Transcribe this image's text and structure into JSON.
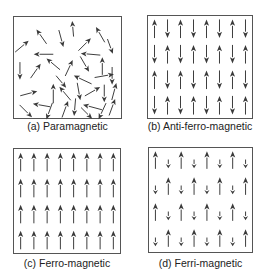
{
  "colors": {
    "arrow": "#3a3a3a",
    "border": "#555555",
    "caption": "#222222"
  },
  "panels": [
    {
      "id": "a",
      "caption": "(a) Paramagnetic",
      "type": "paramagnetic",
      "box": {
        "x": 13,
        "y": 16,
        "w": 109,
        "h": 103
      },
      "caption_pos": {
        "x": 13,
        "y": 120,
        "w": 109
      }
    },
    {
      "id": "b",
      "caption": "(b) Anti-ferro-magnetic",
      "type": "anti-ferromagnetic",
      "box": {
        "x": 147,
        "y": 15,
        "w": 106,
        "h": 104
      },
      "caption_pos": {
        "x": 135,
        "y": 120,
        "w": 130
      }
    },
    {
      "id": "c",
      "caption": "(c) Ferro-magnetic",
      "type": "ferromagnetic",
      "box": {
        "x": 13,
        "y": 148,
        "w": 108,
        "h": 106
      },
      "caption_pos": {
        "x": 13,
        "y": 257,
        "w": 108
      }
    },
    {
      "id": "d",
      "caption": "(d) Ferri-magnetic",
      "type": "ferrimagnetic",
      "box": {
        "x": 148,
        "y": 147,
        "w": 105,
        "h": 106
      },
      "caption_pos": {
        "x": 143,
        "y": 257,
        "w": 115
      }
    }
  ],
  "grid": {
    "rows": 4,
    "cols": 8
  },
  "paramagnetic_arrows": [
    {
      "x": 8,
      "y": 30,
      "angle": -40,
      "len": 18
    },
    {
      "x": 28,
      "y": 20,
      "angle": -125,
      "len": 18
    },
    {
      "x": 48,
      "y": 22,
      "angle": 75,
      "len": 18
    },
    {
      "x": 60,
      "y": 12,
      "angle": -95,
      "len": 16
    },
    {
      "x": 72,
      "y": 28,
      "angle": -45,
      "len": 18
    },
    {
      "x": 88,
      "y": 18,
      "angle": -120,
      "len": 18
    },
    {
      "x": 98,
      "y": 30,
      "angle": 70,
      "len": 16
    },
    {
      "x": 30,
      "y": 38,
      "angle": 180,
      "len": 20
    },
    {
      "x": 78,
      "y": 38,
      "angle": 185,
      "len": 20
    },
    {
      "x": 6,
      "y": 55,
      "angle": 90,
      "len": 18
    },
    {
      "x": 22,
      "y": 55,
      "angle": -55,
      "len": 18
    },
    {
      "x": 40,
      "y": 48,
      "angle": -140,
      "len": 18
    },
    {
      "x": 56,
      "y": 52,
      "angle": -65,
      "len": 18
    },
    {
      "x": 72,
      "y": 48,
      "angle": 60,
      "len": 18
    },
    {
      "x": 90,
      "y": 50,
      "angle": -90,
      "len": 18
    },
    {
      "x": 100,
      "y": 60,
      "angle": 90,
      "len": 18
    },
    {
      "x": 48,
      "y": 66,
      "angle": 50,
      "len": 16
    },
    {
      "x": 70,
      "y": 64,
      "angle": -155,
      "len": 20
    },
    {
      "x": 92,
      "y": 60,
      "angle": -10,
      "len": 20
    },
    {
      "x": 15,
      "y": 78,
      "angle": -15,
      "len": 18
    },
    {
      "x": 40,
      "y": 78,
      "angle": -90,
      "len": 20
    },
    {
      "x": 52,
      "y": 78,
      "angle": -130,
      "len": 18
    },
    {
      "x": 66,
      "y": 76,
      "angle": 80,
      "len": 18
    },
    {
      "x": 80,
      "y": 76,
      "angle": -30,
      "len": 18
    },
    {
      "x": 92,
      "y": 78,
      "angle": 90,
      "len": 18
    },
    {
      "x": 102,
      "y": 76,
      "angle": -75,
      "len": 18
    },
    {
      "x": 28,
      "y": 90,
      "angle": 190,
      "len": 18
    },
    {
      "x": 12,
      "y": 96,
      "angle": 45,
      "len": 18
    },
    {
      "x": 36,
      "y": 96,
      "angle": 110,
      "len": 18
    },
    {
      "x": 52,
      "y": 94,
      "angle": -70,
      "len": 18
    },
    {
      "x": 62,
      "y": 92,
      "angle": 95,
      "len": 18
    },
    {
      "x": 80,
      "y": 92,
      "angle": 195,
      "len": 20
    },
    {
      "x": 74,
      "y": 98,
      "angle": 45,
      "len": 16
    },
    {
      "x": 90,
      "y": 96,
      "angle": 115,
      "len": 18
    },
    {
      "x": 100,
      "y": 92,
      "angle": -70,
      "len": 18
    }
  ]
}
